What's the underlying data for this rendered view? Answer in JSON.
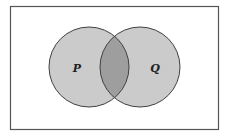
{
  "diagram": {
    "type": "venn",
    "universe": {
      "x": 10,
      "y": 6,
      "width": 208,
      "height": 123,
      "stroke": "#555555",
      "fill": "#ffffff"
    },
    "sets": [
      {
        "name": "P",
        "label": "P",
        "cx": 89,
        "cy": 67,
        "r": 40,
        "fill": "#cbcbcb",
        "label_x": 77,
        "label_y": 72
      },
      {
        "name": "Q",
        "label": "Q",
        "cx": 140,
        "cy": 67,
        "r": 40,
        "fill": "#cbcbcb",
        "label_x": 155,
        "label_y": 72
      }
    ],
    "intersection": {
      "label": "P ∩ Q",
      "fill": "#9e9e9e",
      "shaded": true
    },
    "stroke_color": "#404040"
  }
}
